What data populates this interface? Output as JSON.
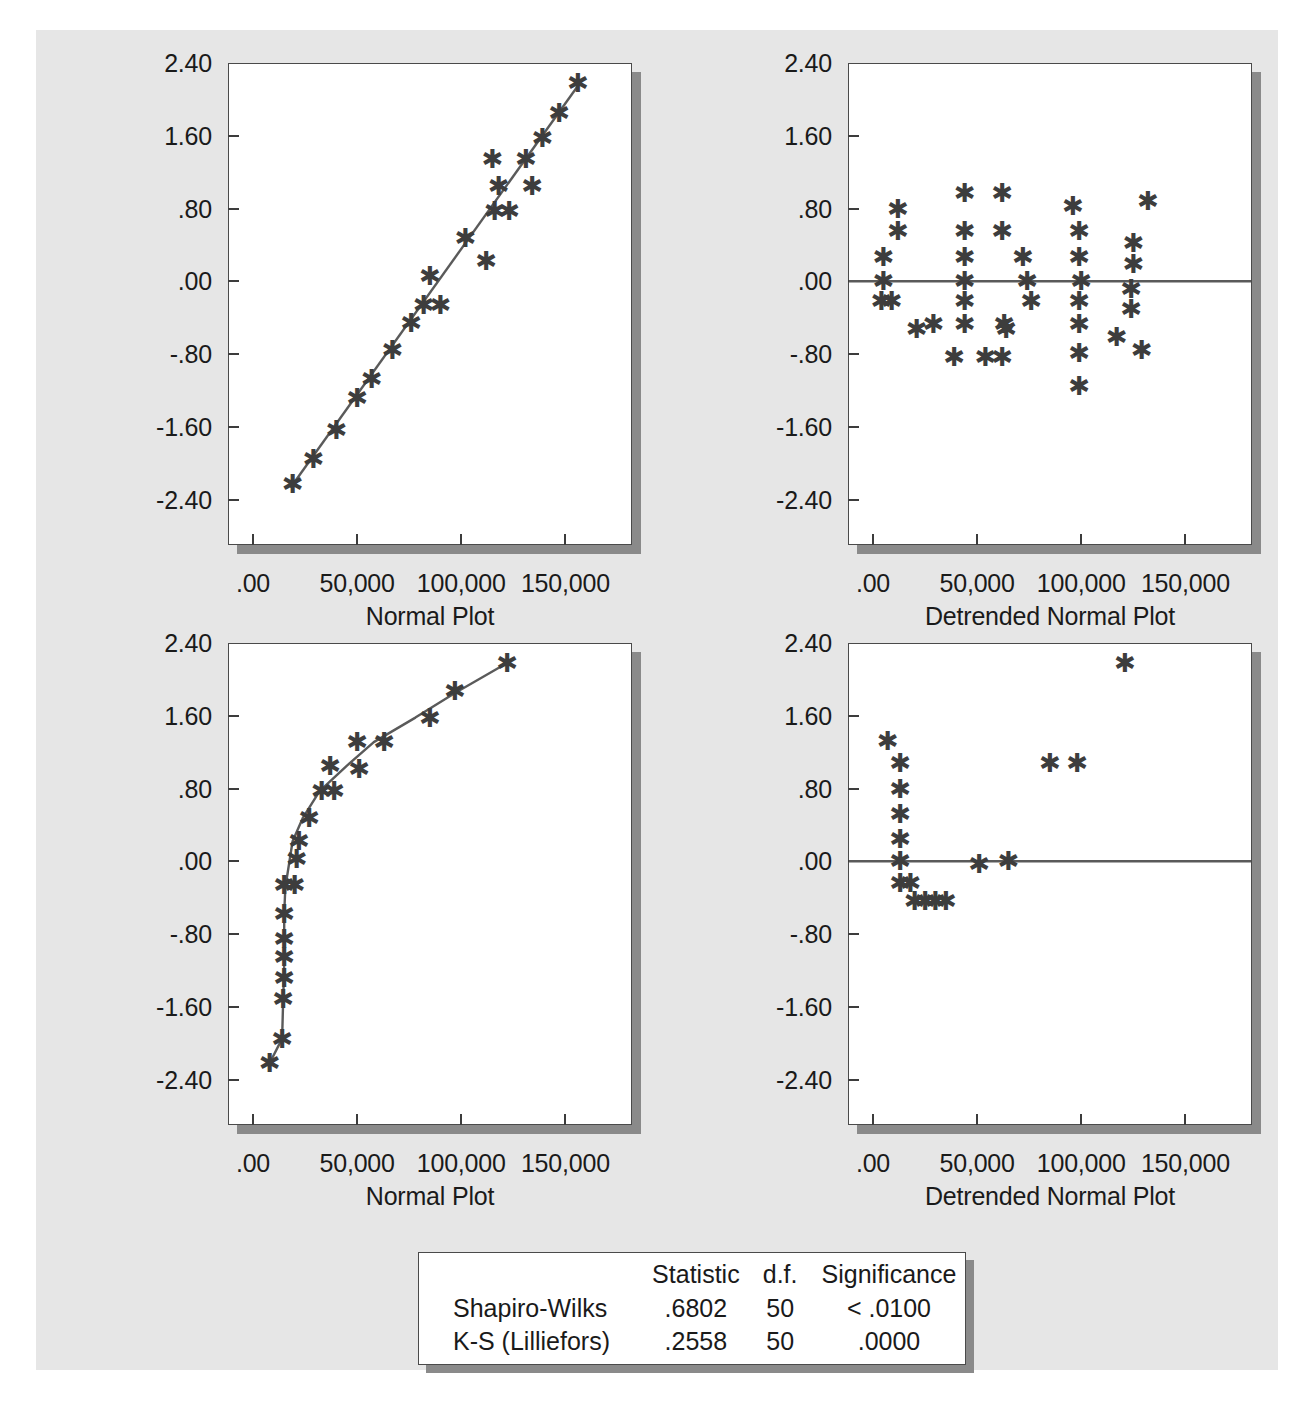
{
  "figure": {
    "background_color": "#e6e6e6",
    "axis_color": "#3c3c3c",
    "marker_color": "#3d3d3d",
    "line_color": "#5a5a5a"
  },
  "plots": [
    {
      "id": "normal-plot-top",
      "position": "top-left",
      "xlabel": "Normal Plot",
      "yticks": [
        "2.40",
        "1.60",
        ".80",
        ".00",
        "-.80",
        "-1.60",
        "-2.40"
      ],
      "xticks": [
        ".00",
        "50,000",
        "100,000",
        "150,000"
      ]
    },
    {
      "id": "detrended-normal-plot-top",
      "position": "top-right",
      "xlabel": "Detrended Normal Plot",
      "yticks": [
        "2.40",
        "1.60",
        ".80",
        ".00",
        "-.80",
        "-1.60",
        "-2.40"
      ],
      "xticks": [
        ".00",
        "50,000",
        "100,000",
        "150,000"
      ]
    },
    {
      "id": "normal-plot-bottom",
      "position": "bottom-left",
      "xlabel": "Normal Plot",
      "yticks": [
        "2.40",
        "1.60",
        ".80",
        ".00",
        "-.80",
        "-1.60",
        "-2.40"
      ],
      "xticks": [
        ".00",
        "50,000",
        "100,000",
        "150,000"
      ]
    },
    {
      "id": "detrended-normal-plot-bottom",
      "position": "bottom-right",
      "xlabel": "Detrended Normal Plot",
      "yticks": [
        "2.40",
        "1.60",
        ".80",
        ".00",
        "-.80",
        "-1.60",
        "-2.40"
      ],
      "xticks": [
        ".00",
        "50,000",
        "100,000",
        "150,000"
      ]
    }
  ],
  "stats_table": {
    "headers": [
      "",
      "Statistic",
      "d.f.",
      "Significance"
    ],
    "rows": [
      {
        "label": "Shapiro-Wilks",
        "statistic": ".6802",
        "df": "50",
        "significance": "< .0100"
      },
      {
        "label": "K-S (Lilliefors)",
        "statistic": ".2558",
        "df": "50",
        "significance": ".0000"
      }
    ]
  },
  "chart_data": [
    {
      "type": "scatter",
      "id": "normal-plot-top",
      "title": "Normal Plot",
      "xlabel": "Normal Plot",
      "ylabel": "Expected Normal Value",
      "xlim": [
        -12000,
        182000
      ],
      "ylim": [
        -2.9,
        2.4
      ],
      "xticks": [
        0,
        50000,
        100000,
        150000
      ],
      "xticklabels": [
        ".00",
        "50,000",
        "100,000",
        "150,000"
      ],
      "yticks": [
        -2.4,
        -1.6,
        -0.8,
        0.0,
        0.8,
        1.6,
        2.4
      ],
      "yticklabels": [
        "-2.40",
        "-1.60",
        "-.80",
        ".00",
        ".80",
        "1.60",
        "2.40"
      ],
      "grid": false,
      "legend": null,
      "reference_line": {
        "kind": "fit-line",
        "x": [
          18000,
          157000
        ],
        "y": [
          -2.27,
          2.18
        ]
      },
      "points": [
        {
          "x": 19000,
          "y": -2.23
        },
        {
          "x": 29000,
          "y": -1.95
        },
        {
          "x": 40000,
          "y": -1.63
        },
        {
          "x": 50000,
          "y": -1.28
        },
        {
          "x": 57000,
          "y": -1.08
        },
        {
          "x": 67000,
          "y": -0.76
        },
        {
          "x": 76000,
          "y": -0.46
        },
        {
          "x": 82000,
          "y": -0.26
        },
        {
          "x": 90000,
          "y": -0.26
        },
        {
          "x": 85000,
          "y": 0.06
        },
        {
          "x": 102000,
          "y": 0.48
        },
        {
          "x": 112000,
          "y": 0.22
        },
        {
          "x": 116000,
          "y": 0.77
        },
        {
          "x": 123000,
          "y": 0.77
        },
        {
          "x": 118000,
          "y": 1.05
        },
        {
          "x": 134000,
          "y": 1.05
        },
        {
          "x": 115000,
          "y": 1.34
        },
        {
          "x": 131000,
          "y": 1.34
        },
        {
          "x": 139000,
          "y": 1.58
        },
        {
          "x": 147000,
          "y": 1.85
        },
        {
          "x": 156000,
          "y": 2.18
        }
      ]
    },
    {
      "type": "scatter",
      "id": "detrended-normal-plot-top",
      "title": "Detrended Normal Plot",
      "xlabel": "Detrended Normal Plot",
      "ylabel": "Deviation from Normal",
      "xlim": [
        -12000,
        182000
      ],
      "ylim": [
        -2.9,
        2.4
      ],
      "xticks": [
        0,
        50000,
        100000,
        150000
      ],
      "xticklabels": [
        ".00",
        "50,000",
        "100,000",
        "150,000"
      ],
      "yticks": [
        -2.4,
        -1.6,
        -0.8,
        0.0,
        0.8,
        1.6,
        2.4
      ],
      "yticklabels": [
        "-2.40",
        "-1.60",
        "-.80",
        ".00",
        ".80",
        "1.60",
        "2.40"
      ],
      "grid": false,
      "legend": null,
      "reference_line": {
        "kind": "zero-line",
        "y": 0.0
      },
      "points": [
        {
          "x": 5000,
          "y": 0.27
        },
        {
          "x": 5000,
          "y": 0.0
        },
        {
          "x": 4000,
          "y": -0.22
        },
        {
          "x": 9000,
          "y": -0.22
        },
        {
          "x": 12000,
          "y": 0.79
        },
        {
          "x": 12000,
          "y": 0.55
        },
        {
          "x": 21000,
          "y": -0.52
        },
        {
          "x": 29000,
          "y": -0.47
        },
        {
          "x": 39000,
          "y": -0.83
        },
        {
          "x": 44000,
          "y": 0.97
        },
        {
          "x": 44000,
          "y": 0.55
        },
        {
          "x": 44000,
          "y": 0.27
        },
        {
          "x": 44000,
          "y": 0.0
        },
        {
          "x": 44000,
          "y": -0.22
        },
        {
          "x": 44000,
          "y": -0.47
        },
        {
          "x": 54000,
          "y": -0.83
        },
        {
          "x": 62000,
          "y": 0.97
        },
        {
          "x": 62000,
          "y": 0.55
        },
        {
          "x": 63000,
          "y": -0.47
        },
        {
          "x": 62000,
          "y": -0.83
        },
        {
          "x": 64000,
          "y": -0.52
        },
        {
          "x": 72000,
          "y": 0.27
        },
        {
          "x": 74000,
          "y": 0.0
        },
        {
          "x": 76000,
          "y": -0.22
        },
        {
          "x": 96000,
          "y": 0.83
        },
        {
          "x": 99000,
          "y": 0.55
        },
        {
          "x": 99000,
          "y": 0.27
        },
        {
          "x": 100000,
          "y": 0.0
        },
        {
          "x": 99000,
          "y": -0.22
        },
        {
          "x": 99000,
          "y": -0.47
        },
        {
          "x": 99000,
          "y": -0.79
        },
        {
          "x": 99000,
          "y": -1.15
        },
        {
          "x": 117000,
          "y": -0.61
        },
        {
          "x": 125000,
          "y": 0.42
        },
        {
          "x": 125000,
          "y": 0.19
        },
        {
          "x": 124000,
          "y": -0.09
        },
        {
          "x": 124000,
          "y": -0.3
        },
        {
          "x": 132000,
          "y": 0.88
        },
        {
          "x": 129000,
          "y": -0.76
        }
      ]
    },
    {
      "type": "scatter",
      "id": "normal-plot-bottom",
      "title": "Normal Plot",
      "xlabel": "Normal Plot",
      "ylabel": "Expected Normal Value",
      "xlim": [
        -12000,
        182000
      ],
      "ylim": [
        -2.9,
        2.4
      ],
      "xticks": [
        0,
        50000,
        100000,
        150000
      ],
      "xticklabels": [
        ".00",
        "50,000",
        "100,000",
        "150,000"
      ],
      "yticks": [
        -2.4,
        -1.6,
        -0.8,
        0.0,
        0.8,
        1.6,
        2.4
      ],
      "yticklabels": [
        "-2.40",
        "-1.60",
        "-.80",
        ".00",
        ".80",
        "1.60",
        "2.40"
      ],
      "grid": false,
      "legend": null,
      "reference_line": {
        "kind": "curve",
        "points": [
          {
            "x": 8000,
            "y": -2.22
          },
          {
            "x": 14000,
            "y": -1.95
          },
          {
            "x": 14500,
            "y": -1.52
          },
          {
            "x": 15000,
            "y": -1.13
          },
          {
            "x": 15000,
            "y": -0.82
          },
          {
            "x": 15000,
            "y": -0.58
          },
          {
            "x": 15500,
            "y": -0.3
          },
          {
            "x": 16000,
            "y": -0.22
          },
          {
            "x": 19000,
            "y": 0.22
          },
          {
            "x": 24000,
            "y": 0.48
          },
          {
            "x": 32000,
            "y": 0.77
          },
          {
            "x": 45000,
            "y": 1.05
          },
          {
            "x": 58000,
            "y": 1.31
          },
          {
            "x": 78000,
            "y": 1.58
          },
          {
            "x": 97000,
            "y": 1.85
          },
          {
            "x": 122000,
            "y": 2.18
          }
        ]
      },
      "points": [
        {
          "x": 8000,
          "y": -2.22
        },
        {
          "x": 14000,
          "y": -1.95
        },
        {
          "x": 14500,
          "y": -1.52
        },
        {
          "x": 15000,
          "y": -1.28
        },
        {
          "x": 15000,
          "y": -1.05
        },
        {
          "x": 15000,
          "y": -0.85
        },
        {
          "x": 15000,
          "y": -0.58
        },
        {
          "x": 15000,
          "y": -0.26
        },
        {
          "x": 20000,
          "y": -0.26
        },
        {
          "x": 21000,
          "y": 0.02
        },
        {
          "x": 22000,
          "y": 0.22
        },
        {
          "x": 27000,
          "y": 0.48
        },
        {
          "x": 33000,
          "y": 0.77
        },
        {
          "x": 39000,
          "y": 0.77
        },
        {
          "x": 37000,
          "y": 1.05
        },
        {
          "x": 51000,
          "y": 1.01
        },
        {
          "x": 50000,
          "y": 1.31
        },
        {
          "x": 63000,
          "y": 1.31
        },
        {
          "x": 85000,
          "y": 1.58
        },
        {
          "x": 97000,
          "y": 1.87
        },
        {
          "x": 122000,
          "y": 2.18
        }
      ]
    },
    {
      "type": "scatter",
      "id": "detrended-normal-plot-bottom",
      "title": "Detrended Normal Plot",
      "xlabel": "Detrended Normal Plot",
      "ylabel": "Deviation from Normal",
      "xlim": [
        -12000,
        182000
      ],
      "ylim": [
        -2.9,
        2.4
      ],
      "xticks": [
        0,
        50000,
        100000,
        150000
      ],
      "xticklabels": [
        ".00",
        "50,000",
        "100,000",
        "150,000"
      ],
      "yticks": [
        -2.4,
        -1.6,
        -0.8,
        0.0,
        0.8,
        1.6,
        2.4
      ],
      "yticklabels": [
        "-2.40",
        "-1.60",
        "-.80",
        ".00",
        ".80",
        "1.60",
        "2.40"
      ],
      "grid": false,
      "legend": null,
      "reference_line": {
        "kind": "zero-line",
        "y": 0.0
      },
      "points": [
        {
          "x": 7000,
          "y": 1.32
        },
        {
          "x": 13000,
          "y": 1.08
        },
        {
          "x": 13000,
          "y": 0.8
        },
        {
          "x": 13000,
          "y": 0.52
        },
        {
          "x": 13000,
          "y": 0.24
        },
        {
          "x": 13000,
          "y": 0.0
        },
        {
          "x": 13000,
          "y": -0.24
        },
        {
          "x": 18000,
          "y": -0.24
        },
        {
          "x": 20000,
          "y": -0.44
        },
        {
          "x": 25000,
          "y": -0.44
        },
        {
          "x": 30000,
          "y": -0.44
        },
        {
          "x": 35000,
          "y": -0.44
        },
        {
          "x": 51000,
          "y": -0.03
        },
        {
          "x": 65000,
          "y": 0.0
        },
        {
          "x": 85000,
          "y": 1.08
        },
        {
          "x": 98000,
          "y": 1.08
        },
        {
          "x": 121000,
          "y": 2.18
        }
      ]
    }
  ]
}
